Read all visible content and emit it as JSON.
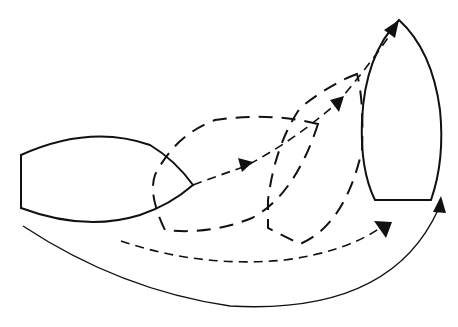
{
  "diagram": {
    "type": "boat-turning-maneuver",
    "colors": {
      "line": "#111111",
      "background": "#ffffff"
    },
    "elements": [
      {
        "id": "boat-start",
        "style": "solid",
        "heading": "east"
      },
      {
        "id": "boat-intermediate-1",
        "style": "dashed",
        "heading": "east-north-east"
      },
      {
        "id": "boat-intermediate-2",
        "style": "dashed",
        "heading": "north-east"
      },
      {
        "id": "boat-end",
        "style": "solid",
        "heading": "north"
      },
      {
        "id": "bow-track",
        "style": "dashed",
        "arrows": 3
      },
      {
        "id": "stern-track",
        "style": "dashed",
        "arrows": 1
      },
      {
        "id": "outer-turn-arc",
        "style": "solid",
        "arrows": 1
      }
    ],
    "text": []
  }
}
